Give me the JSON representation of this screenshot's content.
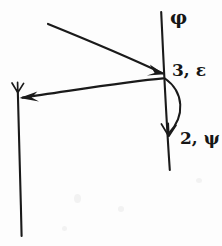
{
  "figure": {
    "background_color": "#fdfdfd",
    "ink_color": "#1a1a1a",
    "width": 222,
    "height": 246
  },
  "labels": {
    "normal_top": "φ",
    "vertex": "3, ε",
    "lower_ray": "2, ψ"
  },
  "geometry": {
    "vertex": {
      "x": 165,
      "y": 76
    },
    "right_vertical_line": {
      "x1": 161,
      "y1": 12,
      "x2": 170,
      "y2": 170
    },
    "left_vertical_line": {
      "x1": 18,
      "y1": 90,
      "x2": 22,
      "y2": 236
    },
    "incoming_ray": {
      "x1": 48,
      "y1": 24,
      "x2": 163,
      "y2": 73
    },
    "outgoing_ray": {
      "x1": 163,
      "y1": 78,
      "x2": 21,
      "y2": 98
    },
    "curved_arc": {
      "start_x": 165,
      "start_y": 78,
      "end_x": 168,
      "end_y": 134,
      "bulge_x": 186
    },
    "arrowheads": [
      {
        "name": "incoming-arrowhead",
        "x": 163,
        "y": 73,
        "direction": "right"
      },
      {
        "name": "outgoing-arrowhead",
        "x": 21,
        "y": 98,
        "direction": "left"
      },
      {
        "name": "left-line-top-arrowhead",
        "x": 18,
        "y": 90,
        "direction": "down"
      },
      {
        "name": "arc-arrowhead",
        "x": 168,
        "y": 134,
        "direction": "down"
      }
    ]
  }
}
